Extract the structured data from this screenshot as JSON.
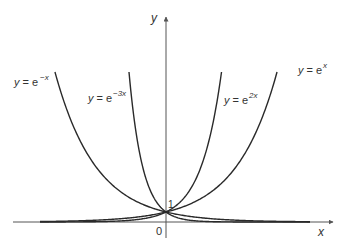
{
  "diagram": {
    "axes": {
      "x_label": "x",
      "y_label": "y",
      "origin_label": "0",
      "intercept_label": "1"
    },
    "curves": [
      {
        "id": "e-neg-x",
        "label_prefix": "y = e",
        "exponent": "−x",
        "k": -1
      },
      {
        "id": "e-neg-3x",
        "label_prefix": "y = e",
        "exponent": "−3x",
        "k": -3
      },
      {
        "id": "e-2x",
        "label_prefix": "y = e",
        "exponent": "2x",
        "k": 2
      },
      {
        "id": "e-x",
        "label_prefix": "y = e",
        "exponent": "x",
        "k": 1
      }
    ],
    "colors": {
      "curve": "#2a2a2a",
      "axis": "#555555",
      "text": "#333333"
    }
  }
}
